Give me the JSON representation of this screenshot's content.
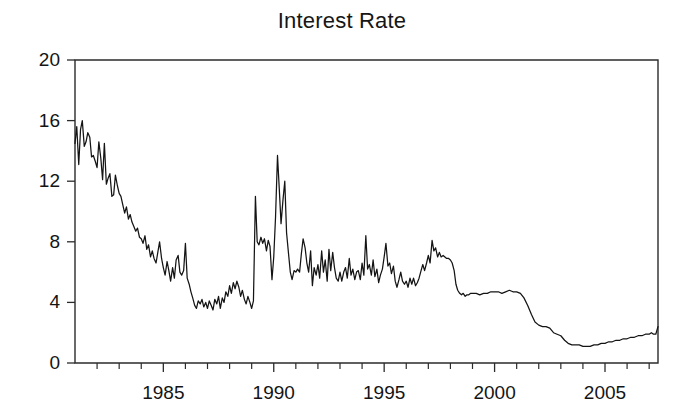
{
  "chart_data": {
    "type": "line",
    "title": "Interest Rate",
    "xlabel": "",
    "ylabel": "",
    "xlim": [
      1981.0,
      2007.4
    ],
    "ylim": [
      0,
      20
    ],
    "grid": false,
    "legend": null,
    "yticks": [
      0,
      4,
      8,
      12,
      16,
      20
    ],
    "ytick_labels": [
      "0",
      "4",
      "8",
      "12",
      "16",
      "20"
    ],
    "xticks": [
      1982,
      1983,
      1984,
      1985,
      1986,
      1987,
      1988,
      1989,
      1990,
      1991,
      1992,
      1993,
      1994,
      1995,
      1996,
      1997,
      1998,
      1999,
      2000,
      2001,
      2002,
      2003,
      2004,
      2005,
      2006,
      2007
    ],
    "xtick_labels_shown": [
      "1985",
      "1990",
      "1995",
      "2000",
      "2005"
    ],
    "xtick_labels_shown_values": [
      1985,
      1990,
      1995,
      2000,
      2005
    ],
    "series": [
      {
        "name": "Interest Rate",
        "color": "#141414",
        "x": [
          1981.0,
          1981.08,
          1981.17,
          1981.25,
          1981.33,
          1981.42,
          1981.5,
          1981.58,
          1981.67,
          1981.75,
          1981.83,
          1981.92,
          1982.0,
          1982.08,
          1982.17,
          1982.25,
          1982.33,
          1982.42,
          1982.5,
          1982.58,
          1982.67,
          1982.75,
          1982.83,
          1982.92,
          1983.0,
          1983.08,
          1983.17,
          1983.25,
          1983.33,
          1983.42,
          1983.5,
          1983.58,
          1983.67,
          1983.75,
          1983.83,
          1983.92,
          1984.0,
          1984.08,
          1984.17,
          1984.25,
          1984.33,
          1984.42,
          1984.5,
          1984.58,
          1984.67,
          1984.75,
          1984.83,
          1984.92,
          1985.0,
          1985.08,
          1985.17,
          1985.25,
          1985.33,
          1985.42,
          1985.5,
          1985.58,
          1985.67,
          1985.75,
          1985.83,
          1985.92,
          1986.0,
          1986.08,
          1986.17,
          1986.25,
          1986.33,
          1986.42,
          1986.5,
          1986.58,
          1986.67,
          1986.75,
          1986.83,
          1986.92,
          1987.0,
          1987.08,
          1987.17,
          1987.25,
          1987.33,
          1987.42,
          1987.5,
          1987.58,
          1987.67,
          1987.75,
          1987.83,
          1987.92,
          1988.0,
          1988.08,
          1988.17,
          1988.25,
          1988.33,
          1988.42,
          1988.5,
          1988.58,
          1988.67,
          1988.75,
          1988.83,
          1988.92,
          1989.0,
          1989.08,
          1989.17,
          1989.25,
          1989.33,
          1989.42,
          1989.5,
          1989.58,
          1989.67,
          1989.75,
          1989.83,
          1989.92,
          1990.0,
          1990.08,
          1990.17,
          1990.25,
          1990.33,
          1990.42,
          1990.5,
          1990.58,
          1990.67,
          1990.75,
          1990.83,
          1990.92,
          1991.0,
          1991.08,
          1991.17,
          1991.25,
          1991.33,
          1991.42,
          1991.5,
          1991.58,
          1991.67,
          1991.75,
          1991.83,
          1991.92,
          1992.0,
          1992.08,
          1992.17,
          1992.25,
          1992.33,
          1992.42,
          1992.5,
          1992.58,
          1992.67,
          1992.75,
          1992.83,
          1992.92,
          1993.0,
          1993.08,
          1993.17,
          1993.25,
          1993.33,
          1993.42,
          1993.5,
          1993.58,
          1993.67,
          1993.75,
          1993.83,
          1993.92,
          1994.0,
          1994.08,
          1994.17,
          1994.25,
          1994.33,
          1994.42,
          1994.5,
          1994.58,
          1994.67,
          1994.75,
          1994.83,
          1994.92,
          1995.0,
          1995.08,
          1995.17,
          1995.25,
          1995.33,
          1995.42,
          1995.5,
          1995.58,
          1995.67,
          1995.75,
          1995.83,
          1995.92,
          1996.0,
          1996.08,
          1996.17,
          1996.25,
          1996.33,
          1996.42,
          1996.5,
          1996.58,
          1996.67,
          1996.75,
          1996.83,
          1996.92,
          1997.0,
          1997.08,
          1997.17,
          1997.25,
          1997.33,
          1997.42,
          1997.5,
          1997.58,
          1997.67,
          1997.75,
          1997.83,
          1997.92,
          1998.0,
          1998.08,
          1998.17,
          1998.25,
          1998.33,
          1998.42,
          1998.5,
          1998.58,
          1998.67,
          1998.75,
          1998.83,
          1998.92,
          1999.0,
          1999.17,
          1999.33,
          1999.5,
          1999.67,
          1999.83,
          2000.0,
          2000.17,
          2000.33,
          2000.5,
          2000.67,
          2000.83,
          2001.0,
          2001.17,
          2001.33,
          2001.5,
          2001.67,
          2001.83,
          2002.0,
          2002.17,
          2002.33,
          2002.5,
          2002.67,
          2002.83,
          2003.0,
          2003.17,
          2003.33,
          2003.5,
          2003.67,
          2003.83,
          2004.0,
          2004.17,
          2004.33,
          2004.5,
          2004.67,
          2004.83,
          2005.0,
          2005.17,
          2005.33,
          2005.5,
          2005.67,
          2005.83,
          2006.0,
          2006.17,
          2006.33,
          2006.5,
          2006.67,
          2006.83,
          2007.0,
          2007.1,
          2007.2,
          2007.3,
          2007.4
        ],
        "y": [
          14.5,
          15.6,
          13.1,
          15.4,
          16.0,
          14.3,
          14.6,
          15.2,
          14.9,
          13.6,
          13.7,
          13.3,
          12.9,
          14.6,
          13.5,
          12.1,
          14.5,
          11.8,
          12.2,
          12.5,
          11.0,
          11.1,
          12.4,
          11.7,
          11.2,
          11.0,
          10.4,
          9.9,
          10.3,
          9.5,
          9.8,
          9.3,
          9.0,
          8.7,
          8.9,
          8.3,
          8.2,
          7.9,
          8.4,
          7.5,
          7.8,
          7.0,
          7.4,
          6.9,
          6.6,
          7.3,
          8.0,
          6.9,
          6.3,
          5.8,
          6.7,
          6.1,
          5.4,
          6.3,
          5.6,
          6.8,
          7.1,
          6.0,
          5.8,
          6.1,
          7.9,
          5.6,
          5.2,
          4.7,
          4.3,
          3.8,
          3.6,
          4.1,
          3.9,
          4.2,
          3.7,
          4.0,
          3.6,
          4.1,
          3.8,
          3.5,
          4.2,
          3.9,
          4.4,
          3.6,
          4.3,
          4.0,
          4.7,
          4.4,
          5.1,
          4.6,
          5.3,
          4.9,
          5.4,
          5.0,
          4.4,
          4.8,
          4.2,
          3.9,
          4.4,
          4.0,
          3.6,
          4.1,
          11.0,
          8.0,
          7.8,
          8.3,
          7.9,
          8.2,
          7.4,
          8.1,
          7.7,
          5.5,
          7.0,
          9.6,
          13.7,
          11.5,
          9.2,
          10.8,
          12.0,
          8.6,
          7.2,
          6.0,
          5.5,
          6.1,
          6.0,
          6.2,
          6.0,
          7.2,
          8.2,
          7.6,
          6.6,
          6.0,
          7.4,
          5.1,
          6.3,
          5.8,
          6.5,
          5.6,
          7.4,
          6.0,
          6.8,
          5.4,
          7.5,
          6.1,
          7.3,
          6.3,
          5.6,
          5.4,
          6.0,
          5.4,
          6.0,
          6.3,
          5.6,
          6.9,
          5.8,
          6.2,
          5.5,
          6.0,
          6.1,
          5.5,
          6.6,
          5.8,
          8.4,
          6.2,
          6.5,
          5.8,
          6.8,
          5.7,
          6.2,
          5.3,
          5.8,
          6.2,
          7.0,
          7.9,
          6.4,
          6.6,
          5.9,
          6.4,
          5.4,
          5.0,
          5.5,
          6.0,
          5.4,
          5.2,
          5.4,
          5.0,
          5.6,
          5.2,
          5.6,
          5.1,
          5.3,
          5.6,
          6.1,
          6.5,
          6.1,
          6.6,
          7.1,
          6.6,
          8.1,
          7.4,
          7.6,
          7.0,
          7.3,
          7.0,
          7.1,
          7.0,
          6.9,
          6.9,
          6.8,
          6.6,
          6.1,
          5.2,
          4.8,
          4.6,
          4.5,
          4.6,
          4.4,
          4.5,
          4.5,
          4.6,
          4.6,
          4.6,
          4.5,
          4.6,
          4.6,
          4.7,
          4.7,
          4.7,
          4.6,
          4.7,
          4.8,
          4.7,
          4.7,
          4.6,
          4.3,
          3.8,
          3.2,
          2.7,
          2.5,
          2.4,
          2.4,
          2.3,
          2.0,
          1.9,
          1.8,
          1.5,
          1.3,
          1.2,
          1.2,
          1.2,
          1.1,
          1.1,
          1.1,
          1.2,
          1.2,
          1.3,
          1.3,
          1.4,
          1.4,
          1.5,
          1.5,
          1.6,
          1.6,
          1.7,
          1.7,
          1.8,
          1.8,
          1.9,
          1.9,
          2.0,
          1.9,
          1.9,
          2.4
        ]
      }
    ]
  },
  "axes": {
    "y_labels": [
      "20",
      "16",
      "12",
      "8",
      "4",
      "0"
    ],
    "x_labels": [
      "1985",
      "1990",
      "1995",
      "2000",
      "2005"
    ]
  },
  "colors": {
    "line": "#141414",
    "axis": "#2b2b2b",
    "background": "#ffffff",
    "text": "#141414"
  }
}
